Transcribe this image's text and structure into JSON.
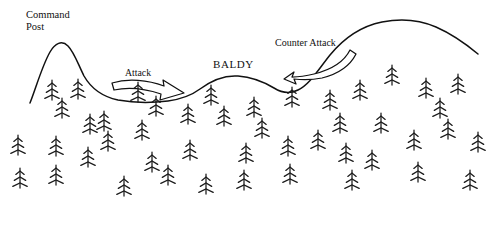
{
  "figure": {
    "type": "terrain-sketch-map",
    "background_color": "#ffffff",
    "ink_color": "#111111",
    "width": 495,
    "height": 233
  },
  "labels": {
    "command_post_line1": "Command",
    "command_post_line2": "Post",
    "baldy": "BALDY",
    "attack": "Attack",
    "counter_attack": "Counter Attack"
  },
  "terrain": {
    "name": "ridge-profile",
    "description": "hand-drawn ridge line with left peak, central rounded hill and right ridge crest",
    "path": "M30,103 C36,88 42,66 50,52 C55,43 62,40 68,46 C74,52 78,64 84,76 C92,90 104,97 118,100 C134,103 152,103 168,101 C182,99 192,95 200,89 C212,80 224,75 238,76 C252,77 264,82 274,88 C282,93 290,94 298,90 C310,84 318,70 330,55 C344,38 362,26 382,22 C402,18 420,20 436,27 C452,34 466,44 478,54"
  },
  "arrows": [
    {
      "name": "attack-arrow",
      "direction": "right",
      "outline_path": "M112,83 C128,78 148,80 164,86 L163,80 L184,93 L160,100 L161,94 C146,89 128,87 114,90 Z"
    },
    {
      "name": "counter-attack-arrow",
      "direction": "left",
      "outline_path": "M350,50 C344,62 330,70 314,74 C306,76 298,77 292,77 L294,72 L284,79 L296,84 L294,79 C302,80 312,80 322,78 C338,74 350,66 356,54 Z"
    }
  ],
  "trees": {
    "symbol": "conifer",
    "branch_levels": 3,
    "count": 46,
    "positions": [
      {
        "x": 52,
        "y": 100
      },
      {
        "x": 78,
        "y": 99
      },
      {
        "x": 62,
        "y": 118
      },
      {
        "x": 104,
        "y": 131
      },
      {
        "x": 142,
        "y": 140
      },
      {
        "x": 188,
        "y": 124
      },
      {
        "x": 224,
        "y": 126
      },
      {
        "x": 254,
        "y": 117
      },
      {
        "x": 292,
        "y": 107
      },
      {
        "x": 330,
        "y": 110
      },
      {
        "x": 360,
        "y": 100
      },
      {
        "x": 392,
        "y": 85
      },
      {
        "x": 426,
        "y": 98
      },
      {
        "x": 458,
        "y": 94
      },
      {
        "x": 138,
        "y": 102
      },
      {
        "x": 211,
        "y": 105
      },
      {
        "x": 56,
        "y": 156
      },
      {
        "x": 88,
        "y": 167
      },
      {
        "x": 152,
        "y": 172
      },
      {
        "x": 190,
        "y": 160
      },
      {
        "x": 246,
        "y": 163
      },
      {
        "x": 288,
        "y": 156
      },
      {
        "x": 318,
        "y": 150
      },
      {
        "x": 346,
        "y": 163
      },
      {
        "x": 381,
        "y": 133
      },
      {
        "x": 414,
        "y": 150
      },
      {
        "x": 448,
        "y": 139
      },
      {
        "x": 478,
        "y": 152
      },
      {
        "x": 56,
        "y": 185
      },
      {
        "x": 124,
        "y": 196
      },
      {
        "x": 168,
        "y": 185
      },
      {
        "x": 206,
        "y": 194
      },
      {
        "x": 244,
        "y": 190
      },
      {
        "x": 290,
        "y": 184
      },
      {
        "x": 352,
        "y": 190
      },
      {
        "x": 372,
        "y": 170
      },
      {
        "x": 418,
        "y": 182
      },
      {
        "x": 470,
        "y": 190
      },
      {
        "x": 20,
        "y": 188
      },
      {
        "x": 18,
        "y": 155
      },
      {
        "x": 108,
        "y": 151
      },
      {
        "x": 262,
        "y": 138
      },
      {
        "x": 340,
        "y": 133
      },
      {
        "x": 440,
        "y": 118
      },
      {
        "x": 156,
        "y": 116
      },
      {
        "x": 90,
        "y": 134
      }
    ]
  }
}
